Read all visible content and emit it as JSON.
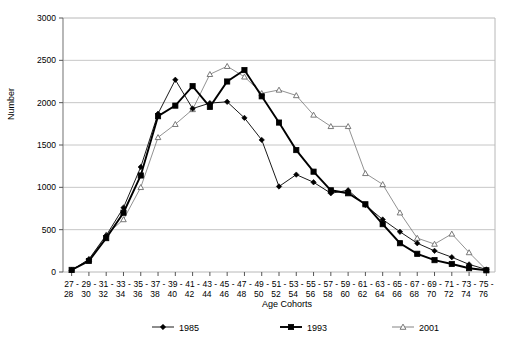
{
  "chart_data": {
    "type": "line",
    "title": "",
    "xlabel": "Age Cohorts",
    "ylabel": "Number",
    "ylim": [
      0,
      3000
    ],
    "ytick_step": 500,
    "yticks": [
      "0",
      "500",
      "1000",
      "1500",
      "2000",
      "2500",
      "3000"
    ],
    "grid": true,
    "legend_position": "bottom",
    "categories": [
      "27 - 28",
      "29 - 30",
      "31 - 32",
      "33 - 34",
      "35 - 36",
      "37 - 38",
      "39 - 40",
      "41 - 42",
      "43 - 44",
      "45 - 46",
      "47 - 48",
      "49 - 50",
      "51 - 52",
      "53 - 54",
      "55 - 56",
      "57 - 58",
      "59 - 60",
      "61 - 62",
      "63 - 64",
      "65 - 66",
      "67 - 68",
      "69 - 70",
      "71 - 72",
      "73 - 74",
      "75 - 76"
    ],
    "categories_top": [
      "27 -",
      "29 -",
      "31 -",
      "33 -",
      "35 -",
      "37 -",
      "39 -",
      "41 -",
      "43 -",
      "45 -",
      "47 -",
      "49 -",
      "51 -",
      "53 -",
      "55 -",
      "57 -",
      "59 -",
      "61 -",
      "63 -",
      "65 -",
      "67 -",
      "69 -",
      "71 -",
      "73 -",
      "75 -"
    ],
    "categories_bottom": [
      "28",
      "30",
      "32",
      "34",
      "36",
      "38",
      "40",
      "42",
      "44",
      "46",
      "48",
      "50",
      "52",
      "54",
      "56",
      "58",
      "60",
      "62",
      "64",
      "66",
      "68",
      "70",
      "72",
      "74",
      "76"
    ],
    "series": [
      {
        "name": "1985",
        "marker": "diamond",
        "color": "#000000",
        "values": [
          20,
          150,
          430,
          760,
          1240,
          1870,
          2270,
          1930,
          1995,
          2010,
          1820,
          1560,
          1010,
          1150,
          1060,
          930,
          965,
          790,
          620,
          475,
          340,
          250,
          175,
          90,
          30
        ]
      },
      {
        "name": "1993",
        "marker": "square",
        "color": "#000000",
        "values": [
          25,
          130,
          400,
          700,
          1140,
          1840,
          1965,
          2195,
          1950,
          2250,
          2385,
          2075,
          1765,
          1440,
          1185,
          965,
          930,
          800,
          565,
          340,
          215,
          140,
          95,
          45,
          20
        ]
      },
      {
        "name": "2001",
        "marker": "triangle",
        "color": "#808080",
        "values": [
          20,
          150,
          440,
          620,
          1000,
          1590,
          1745,
          1920,
          2335,
          2430,
          2305,
          2110,
          2150,
          2085,
          1855,
          1720,
          1720,
          1165,
          1035,
          700,
          400,
          330,
          450,
          230,
          25
        ]
      }
    ]
  },
  "legend": [
    {
      "label": "1985"
    },
    {
      "label": "1993"
    },
    {
      "label": "2001"
    }
  ]
}
